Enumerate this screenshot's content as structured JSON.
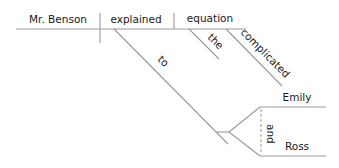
{
  "diagram": {
    "type": "sentence-diagram",
    "sentence_words": {
      "subject": "Mr. Benson",
      "verb": "explained",
      "direct_object": "equation",
      "article": "the",
      "adjective": "complicated",
      "preposition": "to",
      "compound_object_1": "Emily",
      "compound_object_2": "Ross",
      "conjunction": "and"
    },
    "line_color": "#9a9a9a",
    "text_color": "#1a1a1a"
  }
}
